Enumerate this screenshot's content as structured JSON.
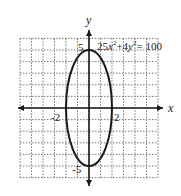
{
  "chart_data": {
    "type": "line",
    "title": "",
    "equation": "25x^2 + 4y^2 = 100",
    "equation_parts": {
      "a": "25",
      "x": "x",
      "p1": "2",
      "plus": "+4",
      "y": "y",
      "p2": "2",
      "eq": "= 100"
    },
    "xlabel": "x",
    "ylabel": "y",
    "xlim": [
      -6,
      6
    ],
    "ylim": [
      -6,
      6
    ],
    "grid": true,
    "grid_style": "dashed",
    "tick_labels": {
      "x": [
        "-2",
        "2"
      ],
      "y": [
        "5",
        "-5"
      ]
    },
    "series": [
      {
        "name": "ellipse",
        "shape": "ellipse",
        "center": [
          0,
          0
        ],
        "semi_axis_x": 2,
        "semi_axis_y": 5,
        "points": [
          [
            2,
            0
          ],
          [
            0,
            5
          ],
          [
            -2,
            0
          ],
          [
            0,
            -5
          ]
        ]
      }
    ],
    "colors": {
      "curve": "#1a1a1a",
      "axes": "#1a1a1a",
      "grid": "#555555"
    }
  }
}
